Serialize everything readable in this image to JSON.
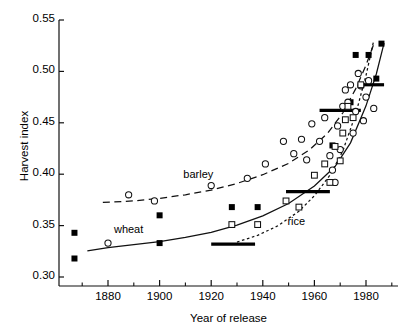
{
  "chart_data": {
    "type": "scatter",
    "title": "",
    "xlabel": "Year of release",
    "ylabel": "Harvest index",
    "xlim": [
      1862,
      1990
    ],
    "ylim": [
      0.295,
      0.558
    ],
    "grid": false,
    "legend": "inline-annotations",
    "x_ticks": [
      1880,
      1900,
      1920,
      1940,
      1960,
      1980
    ],
    "x_tick_labels": [
      "1880",
      "1900",
      "1920",
      "1940",
      "1960",
      "1980"
    ],
    "x_minor_ticks": [
      1870,
      1890,
      1910,
      1930,
      1950,
      1970,
      1990
    ],
    "y_ticks": [
      0.3,
      0.35,
      0.4,
      0.45,
      0.5,
      0.55
    ],
    "y_tick_labels": [
      "0.30",
      "0.35",
      "0.40",
      "0.45",
      "0.50",
      "0.55"
    ],
    "annotations": [
      {
        "text": "wheat",
        "x": 1888,
        "y": 0.345
      },
      {
        "text": "barley",
        "x": 1915,
        "y": 0.398
      },
      {
        "text": "rice",
        "x": 1953,
        "y": 0.353
      }
    ],
    "series": [
      {
        "name": "wheat",
        "marker": "filled-square",
        "line": "solid",
        "line_label": "wheat",
        "points": [
          {
            "x": 1867,
            "y": 0.343
          },
          {
            "x": 1867,
            "y": 0.318
          },
          {
            "x": 1900,
            "y": 0.36
          },
          {
            "x": 1900,
            "y": 0.333
          },
          {
            "x": 1928,
            "y": 0.368
          },
          {
            "x": 1938,
            "y": 0.368
          },
          {
            "x": 1967,
            "y": 0.428
          },
          {
            "x": 1974,
            "y": 0.47
          },
          {
            "x": 1976,
            "y": 0.516
          },
          {
            "x": 1981,
            "y": 0.516
          },
          {
            "x": 1984,
            "y": 0.493
          },
          {
            "x": 1986,
            "y": 0.527
          }
        ],
        "fit_curve": [
          {
            "x": 1872,
            "y": 0.3255
          },
          {
            "x": 1880,
            "y": 0.3285
          },
          {
            "x": 1890,
            "y": 0.3315
          },
          {
            "x": 1900,
            "y": 0.3345
          },
          {
            "x": 1910,
            "y": 0.3385
          },
          {
            "x": 1920,
            "y": 0.3435
          },
          {
            "x": 1930,
            "y": 0.3505
          },
          {
            "x": 1940,
            "y": 0.3595
          },
          {
            "x": 1950,
            "y": 0.3715
          },
          {
            "x": 1960,
            "y": 0.3885
          },
          {
            "x": 1968,
            "y": 0.4075
          },
          {
            "x": 1974,
            "y": 0.4305
          },
          {
            "x": 1980,
            "y": 0.4665
          },
          {
            "x": 1984,
            "y": 0.4975
          },
          {
            "x": 1987,
            "y": 0.5275
          }
        ],
        "mean_bars": [
          {
            "x_start": 1920,
            "x_end": 1937,
            "y": 0.332
          },
          {
            "x_start": 1949,
            "x_end": 1966,
            "y": 0.383
          },
          {
            "x_start": 1962,
            "x_end": 1978,
            "y": 0.462
          },
          {
            "x_start": 1977,
            "x_end": 1987,
            "y": 0.487
          }
        ]
      },
      {
        "name": "barley",
        "marker": "open-circle",
        "line": "dashed",
        "line_label": "barley",
        "points": [
          {
            "x": 1880,
            "y": 0.333
          },
          {
            "x": 1888,
            "y": 0.38
          },
          {
            "x": 1898,
            "y": 0.374
          },
          {
            "x": 1920,
            "y": 0.389
          },
          {
            "x": 1934,
            "y": 0.396
          },
          {
            "x": 1941,
            "y": 0.41
          },
          {
            "x": 1948,
            "y": 0.432
          },
          {
            "x": 1952,
            "y": 0.42
          },
          {
            "x": 1955,
            "y": 0.434
          },
          {
            "x": 1957,
            "y": 0.414
          },
          {
            "x": 1959,
            "y": 0.449
          },
          {
            "x": 1962,
            "y": 0.432
          },
          {
            "x": 1964,
            "y": 0.455
          },
          {
            "x": 1966,
            "y": 0.418
          },
          {
            "x": 1967,
            "y": 0.404
          },
          {
            "x": 1968,
            "y": 0.392
          },
          {
            "x": 1969,
            "y": 0.447
          },
          {
            "x": 1970,
            "y": 0.424
          },
          {
            "x": 1971,
            "y": 0.466
          },
          {
            "x": 1972,
            "y": 0.482
          },
          {
            "x": 1973,
            "y": 0.47
          },
          {
            "x": 1974,
            "y": 0.487
          },
          {
            "x": 1975,
            "y": 0.44
          },
          {
            "x": 1976,
            "y": 0.461
          },
          {
            "x": 1977,
            "y": 0.498
          },
          {
            "x": 1978,
            "y": 0.486
          },
          {
            "x": 1979,
            "y": 0.452
          },
          {
            "x": 1980,
            "y": 0.475
          },
          {
            "x": 1981,
            "y": 0.491
          },
          {
            "x": 1983,
            "y": 0.464
          }
        ],
        "fit_curve": [
          {
            "x": 1878,
            "y": 0.3725
          },
          {
            "x": 1890,
            "y": 0.374
          },
          {
            "x": 1900,
            "y": 0.3765
          },
          {
            "x": 1910,
            "y": 0.38
          },
          {
            "x": 1920,
            "y": 0.3845
          },
          {
            "x": 1930,
            "y": 0.391
          },
          {
            "x": 1940,
            "y": 0.3995
          },
          {
            "x": 1950,
            "y": 0.4105
          },
          {
            "x": 1958,
            "y": 0.4235
          },
          {
            "x": 1965,
            "y": 0.4395
          },
          {
            "x": 1971,
            "y": 0.4595
          },
          {
            "x": 1976,
            "y": 0.483
          },
          {
            "x": 1980,
            "y": 0.506
          },
          {
            "x": 1983,
            "y": 0.5265
          }
        ]
      },
      {
        "name": "rice",
        "marker": "open-square",
        "line": "dotted",
        "line_label": "rice",
        "points": [
          {
            "x": 1928,
            "y": 0.351
          },
          {
            "x": 1938,
            "y": 0.351
          },
          {
            "x": 1949,
            "y": 0.374
          },
          {
            "x": 1954,
            "y": 0.368
          },
          {
            "x": 1960,
            "y": 0.399
          },
          {
            "x": 1964,
            "y": 0.41
          },
          {
            "x": 1966,
            "y": 0.392
          },
          {
            "x": 1968,
            "y": 0.427
          },
          {
            "x": 1970,
            "y": 0.413
          },
          {
            "x": 1971,
            "y": 0.44
          },
          {
            "x": 1972,
            "y": 0.453
          },
          {
            "x": 1973,
            "y": 0.466
          },
          {
            "x": 1975,
            "y": 0.455
          },
          {
            "x": 1978,
            "y": 0.487
          }
        ],
        "fit_curve": [
          {
            "x": 1930,
            "y": 0.334
          },
          {
            "x": 1938,
            "y": 0.3405
          },
          {
            "x": 1946,
            "y": 0.35
          },
          {
            "x": 1954,
            "y": 0.364
          },
          {
            "x": 1960,
            "y": 0.379
          },
          {
            "x": 1966,
            "y": 0.399
          },
          {
            "x": 1971,
            "y": 0.4225
          },
          {
            "x": 1976,
            "y": 0.4585
          },
          {
            "x": 1980,
            "y": 0.496
          },
          {
            "x": 1983,
            "y": 0.53
          }
        ]
      }
    ]
  },
  "axes": {
    "y_label": "Harvest index",
    "x_label": "Year of release"
  }
}
